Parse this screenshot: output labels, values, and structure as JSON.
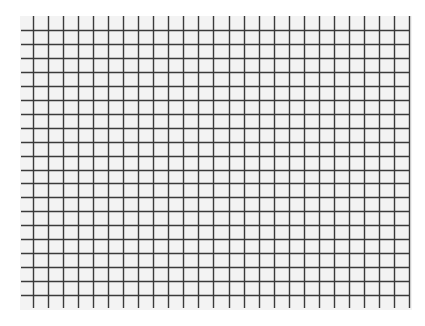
{
  "grid": {
    "background_color": "#f3f3f3",
    "line_color": "#3a3a3a",
    "columns": 26,
    "rows": 20,
    "vertical_line_start_x": 33,
    "vertical_line_spacing": 15.04,
    "vertical_line_top_y": 16,
    "vertical_line_bottom_y": 308,
    "horizontal_line_start_y": 30,
    "horizontal_line_spacing": 13.95,
    "horizontal_line_left_x": 21,
    "horizontal_line_right_x": 410
  }
}
